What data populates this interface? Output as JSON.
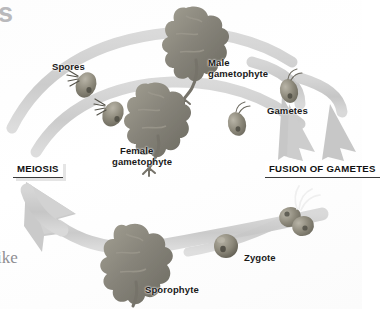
{
  "figure": {
    "type": "life-cycle-diagram",
    "background_color": "#ffffff",
    "arrow_color": "#c9c9c9",
    "organism_color": "#8d8d82",
    "label_color": "#1a1a1a"
  },
  "stage_labels": {
    "meiosis": "MEIOSIS",
    "fusion": "FUSION OF GAMETES"
  },
  "structure_labels": {
    "spores": "Spores",
    "male_gametophyte_line1": "Male",
    "male_gametophyte_line2": "gametophyte",
    "female_gametophyte_line1": "Female",
    "female_gametophyte_line2": "gametophyte",
    "gametes": "Gametes",
    "zygote": "Zygote",
    "sporophyte": "Sporophyte"
  },
  "page_bleed": {
    "top_fragment": "s",
    "left_fragment": "ike"
  },
  "icon_names": [
    "spore-cell-icon",
    "gamete-cell-icon",
    "fusing-gametes-icon",
    "zygote-sphere-icon",
    "thallus-gametophyte-icon",
    "thallus-sporophyte-icon",
    "curved-arrow-icon"
  ]
}
